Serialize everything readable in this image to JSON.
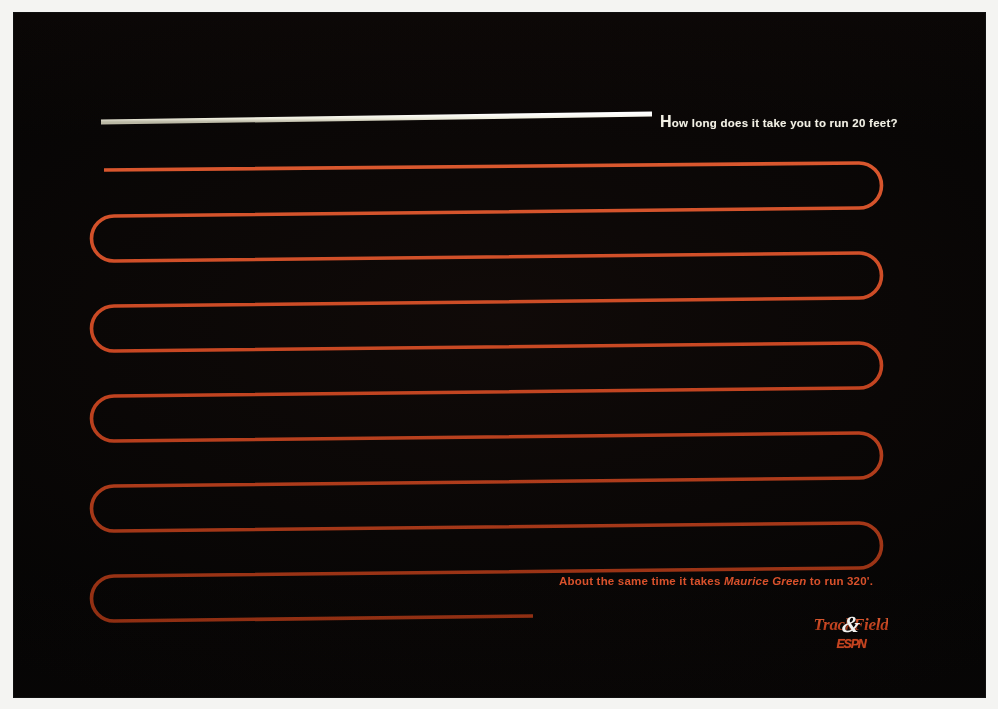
{
  "page": {
    "background_color": "#040404",
    "frame_color": "#f4f4f2",
    "accent_color": "#c4431f",
    "headline_color": "#f2f0e4",
    "kicker_color": "#d8502a"
  },
  "headline": {
    "lead_cap": "H",
    "rest": "ow long does it take you to run 20 feet?",
    "full_text": "How long does it take you to run 20 feet?"
  },
  "kicker": {
    "before_name": "About the same time it takes ",
    "name": "Maurice Green",
    "after_name": " to run 320'.",
    "full_text": "About the same time it takes Maurice Green to run 320'."
  },
  "logo": {
    "word_left": "Track",
    "ampersand": "&",
    "word_right": "Field",
    "network": "ESPN",
    "full_text": "Track & Field ESPN"
  },
  "artwork": {
    "type": "serpentine-track-diagram",
    "short_line": {
      "name": "20-feet-line",
      "color": "#efeede",
      "label": "How long does it take you to run 20 feet?",
      "length_label": "20 feet"
    },
    "long_line": {
      "name": "320-feet-serpentine",
      "color": "#c4431f",
      "label": "About the same time it takes Maurice Green to run 320'.",
      "length_label": "320 feet",
      "switchback_count": 11
    }
  }
}
